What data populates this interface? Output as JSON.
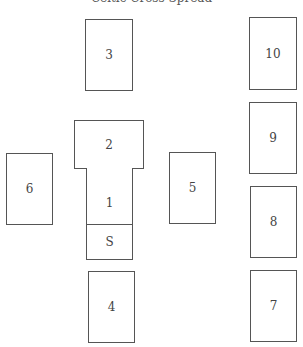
{
  "diagram": {
    "title": "Celtic Cross Spread",
    "border_color": "#555555",
    "text_color": "#444444",
    "positions": [
      {
        "id": "3",
        "label": "3",
        "x": 85,
        "y": 19,
        "w": 48,
        "h": 72
      },
      {
        "id": "10",
        "label": "10",
        "x": 249,
        "y": 17,
        "w": 48,
        "h": 73
      },
      {
        "id": "2",
        "label": "2",
        "x": 74,
        "y": 120,
        "w": 70,
        "h": 48
      },
      {
        "id": "9",
        "label": "9",
        "x": 249,
        "y": 102,
        "w": 48,
        "h": 72
      },
      {
        "id": "6",
        "label": "6",
        "x": 6,
        "y": 153,
        "w": 47,
        "h": 72
      },
      {
        "id": "1",
        "label": "1",
        "x": 86,
        "y": 168,
        "w": 47,
        "h": 57
      },
      {
        "id": "S",
        "label": "S",
        "x": 86,
        "y": 224,
        "w": 47,
        "h": 36
      },
      {
        "id": "5",
        "label": "5",
        "x": 169,
        "y": 152,
        "w": 47,
        "h": 72
      },
      {
        "id": "8",
        "label": "8",
        "x": 250,
        "y": 186,
        "w": 47,
        "h": 72
      },
      {
        "id": "4",
        "label": "4",
        "x": 88,
        "y": 271,
        "w": 47,
        "h": 72
      },
      {
        "id": "7",
        "label": "7",
        "x": 250,
        "y": 270,
        "w": 47,
        "h": 72
      }
    ]
  }
}
